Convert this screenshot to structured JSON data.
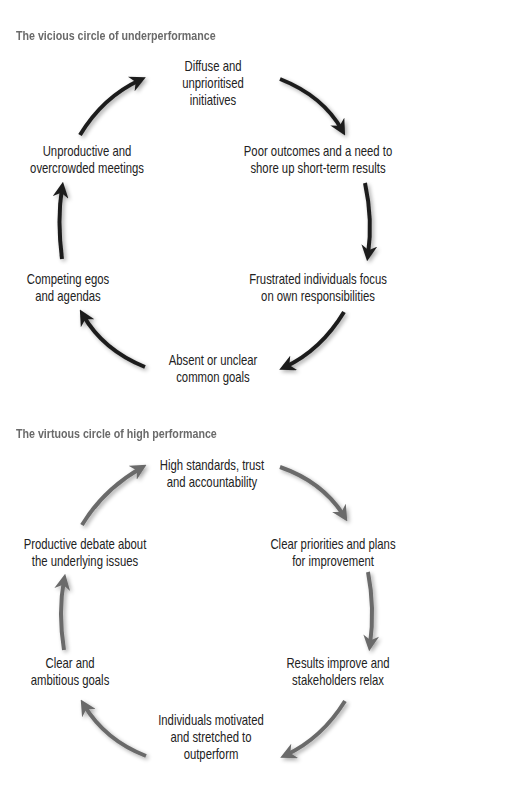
{
  "diagrams": [
    {
      "title": "The vicious circle of underperformance",
      "arrow_color": "#1e1e1e",
      "nodes": [
        {
          "lines": [
            "Diffuse and",
            "unprioritised",
            "initiatives"
          ]
        },
        {
          "lines": [
            "Poor outcomes and a need to",
            "shore up short-term results"
          ]
        },
        {
          "lines": [
            "Frustrated individuals focus",
            "on own responsibilities"
          ]
        },
        {
          "lines": [
            "Absent or unclear",
            "common goals"
          ]
        },
        {
          "lines": [
            "Competing egos",
            "and agendas"
          ]
        },
        {
          "lines": [
            "Unproductive and",
            "overcrowded meetings"
          ]
        }
      ]
    },
    {
      "title": "The virtuous circle of high performance",
      "arrow_color": "#6b6b6b",
      "nodes": [
        {
          "lines": [
            "High standards, trust",
            "and accountability"
          ]
        },
        {
          "lines": [
            "Clear priorities and plans",
            "for improvement"
          ]
        },
        {
          "lines": [
            "Results improve and",
            "stakeholders relax"
          ]
        },
        {
          "lines": [
            "Individuals motivated",
            "and stretched to",
            "outperform"
          ]
        },
        {
          "lines": [
            "Clear and",
            "ambitious goals"
          ]
        },
        {
          "lines": [
            "Productive debate about",
            "the underlying issues"
          ]
        }
      ]
    }
  ]
}
